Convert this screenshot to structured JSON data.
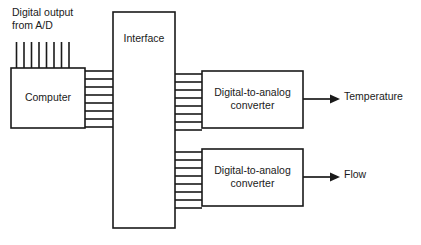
{
  "diagram": {
    "canvas": {
      "width": 421,
      "height": 245,
      "background": "#ffffff"
    },
    "stroke_color": "#1a1a1a",
    "labels": {
      "source": "Digital output\nfrom A/D",
      "interface": "Interface",
      "computer": "Computer",
      "dac_top": "Digital-to-analog\nconverter",
      "dac_bottom": "Digital-to-analog\nconverter",
      "output_top": "Temperature",
      "output_bottom": "Flow"
    },
    "boxes": [
      {
        "name": "computer",
        "label": "Computer",
        "x": 11,
        "y": 68,
        "w": 74,
        "h": 60
      },
      {
        "name": "interface",
        "label": "Interface",
        "x": 113,
        "y": 12,
        "w": 62,
        "h": 216
      },
      {
        "name": "dac-top",
        "label": "Digital-to-analog converter",
        "x": 202,
        "y": 71,
        "w": 101,
        "h": 57
      },
      {
        "name": "dac-bottom",
        "label": "Digital-to-analog converter",
        "x": 202,
        "y": 149,
        "w": 101,
        "h": 57
      }
    ],
    "buses": [
      {
        "name": "computer-to-interface",
        "lines": 8,
        "x1": 85,
        "x2": 113,
        "y_start": 71,
        "y_step": 8
      },
      {
        "name": "interface-to-dac-top",
        "lines": 8,
        "x1": 175,
        "x2": 202,
        "y_start": 74,
        "y_step": 8
      },
      {
        "name": "interface-to-dac-bottom",
        "lines": 8,
        "x1": 175,
        "x2": 202,
        "y_start": 152,
        "y_step": 8
      }
    ],
    "input_lines": {
      "name": "ad-input-lines",
      "count": 8,
      "x_start": 16,
      "x_step": 7.4,
      "y_top": 42,
      "y_bottom": 68
    },
    "arrows": [
      {
        "name": "temperature-arrow",
        "x1": 303,
        "x2": 337,
        "y": 99
      },
      {
        "name": "flow-arrow",
        "x1": 303,
        "x2": 337,
        "y": 177
      }
    ]
  }
}
